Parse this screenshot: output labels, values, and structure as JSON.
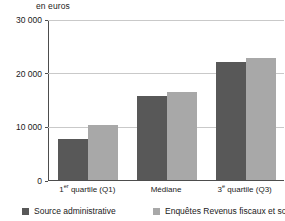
{
  "unit_caption": "en euros",
  "chart_data": {
    "type": "bar",
    "title": "",
    "subtitle": "",
    "xlabel": "",
    "ylabel": "en euros",
    "ylim": [
      0,
      30000
    ],
    "grid": true,
    "legend_position": "bottom",
    "categories": [
      "1er quartile (Q1)",
      "Médiane",
      "3e quartile (Q3)"
    ],
    "category_labels_html": [
      {
        "main": "1",
        "sup": "er",
        "rest": " quartile (Q1)"
      },
      {
        "main": "Médiane",
        "sup": "",
        "rest": ""
      },
      {
        "main": "3",
        "sup": "e",
        "rest": " quartile (Q3)"
      }
    ],
    "ytick_labels": [
      "0",
      "10 000",
      "20 000",
      "30 000"
    ],
    "ytick_values": [
      0,
      10000,
      20000,
      30000
    ],
    "series": [
      {
        "name": "Source administrative",
        "color": "#585858",
        "values": [
          7700,
          15600,
          22000
        ]
      },
      {
        "name": "Enquêtes Revenus fiscaux et sociaux",
        "color": "#a8a8a8",
        "values": [
          10200,
          16400,
          22800
        ]
      }
    ]
  },
  "legend": {
    "items": [
      {
        "label": "Source administrative",
        "color": "#585858"
      },
      {
        "label": "Enquêtes Revenus fiscaux et sociaux",
        "color": "#a8a8a8"
      }
    ]
  },
  "colors": {
    "series_dark": "#585858",
    "series_light": "#a8a8a8",
    "gridline": "#c9c9c9",
    "axis": "#4d4d4d",
    "background": "#ffffff",
    "text": "#1a1a1a"
  }
}
